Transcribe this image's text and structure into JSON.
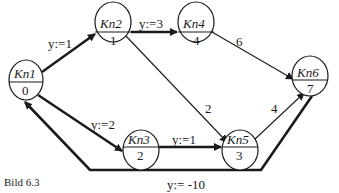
{
  "caption": "Bild 6.3",
  "nodes": [
    {
      "id": "Kn1",
      "name": "Kn1",
      "value": "0",
      "cx": 26,
      "cy": 80
    },
    {
      "id": "Kn2",
      "name": "Kn2",
      "value": "1",
      "cx": 113,
      "cy": 22
    },
    {
      "id": "Kn4",
      "name": "Kn4",
      "value": "4",
      "cx": 196,
      "cy": 22
    },
    {
      "id": "Kn6",
      "name": "Kn6",
      "value": "7",
      "cx": 310,
      "cy": 76
    },
    {
      "id": "Kn3",
      "name": "Kn3",
      "value": "2",
      "cx": 141,
      "cy": 150
    },
    {
      "id": "Kn5",
      "name": "Kn5",
      "value": "3",
      "cx": 240,
      "cy": 150
    }
  ],
  "edges": [
    {
      "from": "Kn1",
      "to": "Kn2",
      "label": "y:=1",
      "bold": true
    },
    {
      "from": "Kn2",
      "to": "Kn4",
      "label": "y:=3",
      "bold": true
    },
    {
      "from": "Kn4",
      "to": "Kn6",
      "label": "6",
      "bold": false
    },
    {
      "from": "Kn2",
      "to": "Kn5",
      "label": "2",
      "bold": false
    },
    {
      "from": "Kn1",
      "to": "Kn3",
      "label": "y:=2",
      "bold": true
    },
    {
      "from": "Kn3",
      "to": "Kn5",
      "label": "y:=1",
      "bold": true
    },
    {
      "from": "Kn5",
      "to": "Kn6",
      "label": "4",
      "bold": false
    },
    {
      "from": "Kn6",
      "to": "Kn1",
      "label": "y:= -10",
      "bold": true
    }
  ]
}
